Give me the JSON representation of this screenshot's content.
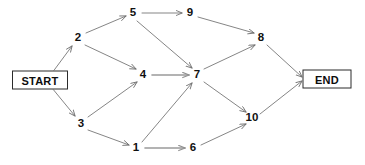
{
  "diagram": {
    "type": "directed-graph",
    "width": 365,
    "height": 165,
    "background_color": "#ffffff",
    "edge_color": "#6f6f6f",
    "edge_color_dark": "#9a9a9a",
    "node_text_color": "#111111",
    "terminal_border_color": "#2b2b2b",
    "start": {
      "label": "START",
      "x": 40,
      "y": 80,
      "w": 56,
      "h": 19
    },
    "end": {
      "label": "END",
      "x": 327,
      "y": 79,
      "w": 49,
      "h": 19
    },
    "nodes": [
      {
        "id": "1",
        "label": "1",
        "x": 136,
        "y": 148
      },
      {
        "id": "2",
        "label": "2",
        "x": 78,
        "y": 38
      },
      {
        "id": "3",
        "label": "3",
        "x": 81,
        "y": 124
      },
      {
        "id": "4",
        "label": "4",
        "x": 143,
        "y": 75
      },
      {
        "id": "5",
        "label": "5",
        "x": 133,
        "y": 13
      },
      {
        "id": "6",
        "label": "6",
        "x": 193,
        "y": 148
      },
      {
        "id": "7",
        "label": "7",
        "x": 197,
        "y": 75
      },
      {
        "id": "8",
        "label": "8",
        "x": 261,
        "y": 38
      },
      {
        "id": "9",
        "label": "9",
        "x": 190,
        "y": 13
      },
      {
        "id": "10",
        "label": "10",
        "x": 252,
        "y": 118
      }
    ],
    "edges": [
      {
        "from": "START",
        "to": "2",
        "x1": 52,
        "y1": 73,
        "x2": 72,
        "y2": 46,
        "weight": "thin"
      },
      {
        "from": "START",
        "to": "3",
        "x1": 52,
        "y1": 88,
        "x2": 75,
        "y2": 116,
        "weight": "thin"
      },
      {
        "from": "2",
        "to": "5",
        "x1": 86,
        "y1": 33,
        "x2": 126,
        "y2": 16,
        "weight": "thin"
      },
      {
        "from": "2",
        "to": "4",
        "x1": 85,
        "y1": 45,
        "x2": 136,
        "y2": 69,
        "weight": "thin"
      },
      {
        "from": "3",
        "to": "4",
        "x1": 88,
        "y1": 117,
        "x2": 137,
        "y2": 82,
        "weight": "thin"
      },
      {
        "from": "3",
        "to": "1",
        "x1": 88,
        "y1": 130,
        "x2": 129,
        "y2": 145,
        "weight": "thin"
      },
      {
        "from": "5",
        "to": "9",
        "x1": 142,
        "y1": 13,
        "x2": 182,
        "y2": 13,
        "weight": "thin"
      },
      {
        "from": "5",
        "to": "7",
        "x1": 137,
        "y1": 21,
        "x2": 192,
        "y2": 68,
        "weight": "thin"
      },
      {
        "from": "9",
        "to": "8",
        "x1": 198,
        "y1": 17,
        "x2": 254,
        "y2": 33,
        "weight": "thin"
      },
      {
        "from": "4",
        "to": "7",
        "x1": 152,
        "y1": 75,
        "x2": 189,
        "y2": 75,
        "weight": "thick"
      },
      {
        "from": "1",
        "to": "7",
        "x1": 142,
        "y1": 142,
        "x2": 192,
        "y2": 83,
        "weight": "thin"
      },
      {
        "from": "1",
        "to": "6",
        "x1": 145,
        "y1": 148,
        "x2": 185,
        "y2": 148,
        "weight": "thick"
      },
      {
        "from": "6",
        "to": "10",
        "x1": 201,
        "y1": 145,
        "x2": 246,
        "y2": 124,
        "weight": "thin"
      },
      {
        "from": "7",
        "to": "8",
        "x1": 204,
        "y1": 69,
        "x2": 255,
        "y2": 45,
        "weight": "thin"
      },
      {
        "from": "7",
        "to": "10",
        "x1": 204,
        "y1": 82,
        "x2": 246,
        "y2": 112,
        "weight": "thin"
      },
      {
        "from": "8",
        "to": "END",
        "x1": 267,
        "y1": 45,
        "x2": 302,
        "y2": 77,
        "weight": "thin"
      },
      {
        "from": "10",
        "to": "END",
        "x1": 260,
        "y1": 114,
        "x2": 302,
        "y2": 81,
        "weight": "thin"
      }
    ]
  }
}
